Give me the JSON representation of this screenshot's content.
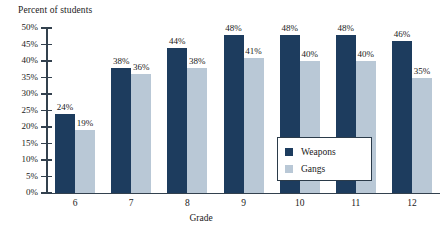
{
  "chart_data": {
    "type": "bar",
    "title": "",
    "ylabel": "Percent of students",
    "xlabel": "Grade",
    "categories": [
      "6",
      "7",
      "8",
      "9",
      "10",
      "11",
      "12"
    ],
    "series": [
      {
        "name": "Weapons",
        "color": "#1d3c5e",
        "values": [
          24,
          38,
          44,
          48,
          48,
          48,
          46
        ],
        "labels": [
          "24%",
          "38%",
          "44%",
          "48%",
          "48%",
          "48%",
          "46%"
        ]
      },
      {
        "name": "Gangs",
        "color": "#b9c8d6",
        "values": [
          19,
          36,
          38,
          41,
          40,
          40,
          35
        ],
        "labels": [
          "19%",
          "36%",
          "38%",
          "41%",
          "40%",
          "40%",
          "35%"
        ]
      }
    ],
    "ylim": [
      0,
      50
    ],
    "ytick_values": [
      50,
      45,
      40,
      35,
      30,
      25,
      20,
      15,
      10,
      5,
      0
    ],
    "ytick_labels": [
      "50%",
      "45%",
      "40%",
      "35%",
      "30%",
      "25%",
      "20%",
      "15%",
      "10%",
      "5%",
      "0%"
    ],
    "grid": false,
    "legend_position": "inside-center-right",
    "legend_entries": [
      "Weapons",
      "Gangs"
    ]
  },
  "axis": {
    "y_title": "Percent of students",
    "x_title": "Grade"
  },
  "legend": {
    "items": [
      {
        "label": "Weapons",
        "swatch": "weapons"
      },
      {
        "label": "Gangs",
        "swatch": "gangs"
      }
    ]
  },
  "colors": {
    "weapons": "#1d3c5e",
    "gangs": "#b9c8d6",
    "axis": "#33414e",
    "background": "#ffffff"
  }
}
